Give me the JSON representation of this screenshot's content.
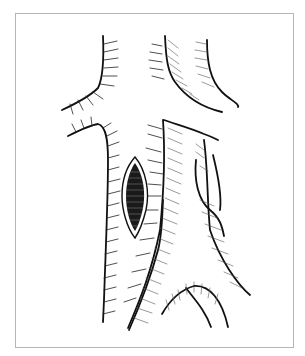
{
  "figure": {
    "colors": {
      "background": "#ffffff",
      "frame_border": "#b5b5b5",
      "ink": "#111111"
    }
  }
}
